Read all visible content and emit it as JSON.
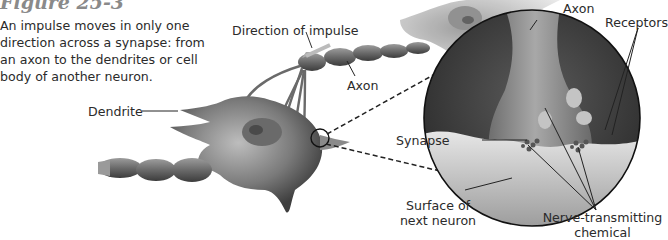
{
  "figure": {
    "title": "Figure 25-3",
    "caption": "An impulse moves in only one direction across a synapse: from an axon to the dendrites or cell body of another neuron."
  },
  "labels": {
    "direction_of_impulse": "Direction of impulse",
    "axon_main": "Axon",
    "dendrite": "Dendrite",
    "axon_inset": "Axon",
    "receptors": "Receptors",
    "synapse": "Synapse",
    "surface_line1": "Surface of",
    "surface_line2": "next neuron",
    "chemical_line1": "Nerve-transmitting",
    "chemical_line2": "chemical"
  },
  "colors": {
    "title": "#8a8a8a",
    "text": "#2b2b2b",
    "neuron_dark": "#4a4a4a",
    "neuron_light": "#cfcfcf"
  }
}
